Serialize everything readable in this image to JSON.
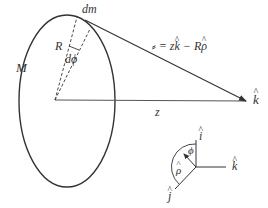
{
  "diagram": {
    "labels": {
      "mass": "M",
      "mass_element": "dm",
      "radius": "R",
      "angle_element": "dϕ",
      "distance": "z",
      "k_hat_main": "k",
      "equation_prefix": "= z",
      "equation_k": "k",
      "equation_mid": " − R",
      "equation_rho": "ρ",
      "axis_i": "i",
      "axis_k": "k",
      "axis_j": "j",
      "axis_phi": "ϕ",
      "axis_rho": "ρ"
    },
    "colors": {
      "stroke": "#333333",
      "background": "#ffffff"
    }
  }
}
